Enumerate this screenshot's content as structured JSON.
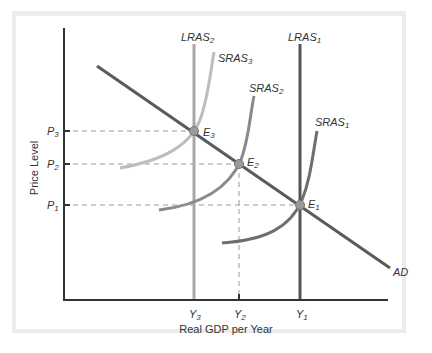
{
  "diagram": {
    "type": "AD-AS model",
    "axes": {
      "x_label": "Real GDP per Year",
      "y_label": "Price Level"
    },
    "curves": [
      {
        "id": "lras2",
        "label": "LRAS",
        "sub": "2",
        "kind": "vertical",
        "color": "#a8a8a8"
      },
      {
        "id": "lras1",
        "label": "LRAS",
        "sub": "1",
        "kind": "vertical",
        "color": "#555555"
      },
      {
        "id": "sras3",
        "label": "SRAS",
        "sub": "3",
        "kind": "upward-curve",
        "color": "#bdbdbd"
      },
      {
        "id": "sras2",
        "label": "SRAS",
        "sub": "2",
        "kind": "upward-curve",
        "color": "#8a8a8a"
      },
      {
        "id": "sras1",
        "label": "SRAS",
        "sub": "1",
        "kind": "upward-curve",
        "color": "#6e6e6e"
      },
      {
        "id": "ad",
        "label": "AD",
        "sub": "",
        "kind": "downward-line",
        "color": "#5a5a5a"
      }
    ],
    "equilibria": [
      {
        "label": "E",
        "sub": "3",
        "price": "P3",
        "output": "Y3"
      },
      {
        "label": "E",
        "sub": "2",
        "price": "P2",
        "output": "Y2"
      },
      {
        "label": "E",
        "sub": "1",
        "price": "P1",
        "output": "Y1"
      }
    ],
    "y_ticks": [
      {
        "label": "P",
        "sub": "3"
      },
      {
        "label": "P",
        "sub": "2"
      },
      {
        "label": "P",
        "sub": "1"
      }
    ],
    "x_ticks": [
      {
        "label": "Y",
        "sub": "3"
      },
      {
        "label": "Y",
        "sub": "2"
      },
      {
        "label": "Y",
        "sub": "1"
      }
    ],
    "colors": {
      "axis": "#333333",
      "guide": "#999999",
      "point_fill": "#9a9a9a",
      "frame": "#ececec"
    }
  }
}
